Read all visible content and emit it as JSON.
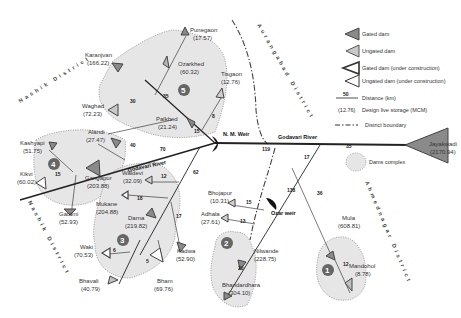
{
  "legend": {
    "gated_dam": "Gated dam",
    "ungated_dam": "Ungated dam",
    "gated_uc": "Gated dam (under construction)",
    "ungated_uc": "Ungated dam (under construction)",
    "distance_sample": "50",
    "distance": "Distance (km)",
    "storage_sample": "(12.76)",
    "storage": "Design live storage (MCM)",
    "boundary": "District boundary",
    "complex": "Dams complex"
  },
  "districts": {
    "nashik_top": "Nashik District",
    "nashik_bottom": "Nashik District",
    "aurangabad": "Aurangabad District",
    "ahmednagar": "Ahmednagar District"
  },
  "river": "Godavari River",
  "weirs": {
    "nm": "N. M. Weir",
    "ozar": "Ozar weir"
  },
  "complexes": [
    "1",
    "2",
    "3",
    "4",
    "5"
  ],
  "dams": {
    "pune": {
      "name": "Punegaon",
      "storage": "(17.57)"
    },
    "ozarkhed": {
      "name": "Ozarkhed",
      "storage": "(60.32)"
    },
    "karanjvan": {
      "name": "Karanjvan",
      "storage": "(166.22)"
    },
    "tisgaon": {
      "name": "Tisgaon",
      "storage": "(12.76)"
    },
    "waghad": {
      "name": "Waghad",
      "storage": "(72.23)"
    },
    "palkhed": {
      "name": "Palkhed",
      "storage": "(21.24)"
    },
    "jayakwadi": {
      "name": "Jayakwadi",
      "storage": "(2170.94)"
    },
    "kashyapi": {
      "name": "Kashyapi",
      "storage": "(51.75)"
    },
    "alandi": {
      "name": "Alandi",
      "storage": "(27.47)"
    },
    "kikvi": {
      "name": "Kikvi",
      "storage": "(60.02)"
    },
    "gangapur": {
      "name": "Gangapur",
      "storage": "(203.88)"
    },
    "gautmi": {
      "name": "Gautmi",
      "storage": "(52.93)"
    },
    "waldevi": {
      "name": "Waldevi",
      "storage": "(32.09)"
    },
    "mukane": {
      "name": "Mukane",
      "storage": "(204.88)"
    },
    "darna": {
      "name": "Darna",
      "storage": "(219.82)"
    },
    "kadwa": {
      "name": "Kadwa",
      "storage": "(52.90)"
    },
    "waki": {
      "name": "Waki",
      "storage": "(70.53)"
    },
    "bhavali": {
      "name": "Bhavali",
      "storage": "(40.79)"
    },
    "bham": {
      "name": "Bham",
      "storage": "(69.76)"
    },
    "bhojapur": {
      "name": "Bhojapur",
      "storage": "(10.31)"
    },
    "adhala": {
      "name": "Adhala",
      "storage": "(27.61)"
    },
    "nilwande": {
      "name": "Nilwande",
      "storage": "(228.75)"
    },
    "bhandardhara": {
      "name": "Bhandardhara",
      "storage": "(304.10)"
    },
    "mula": {
      "name": "Mula",
      "storage": "(608.81)"
    },
    "mandohol": {
      "name": "Mandohol",
      "storage": "(8.78)"
    }
  },
  "distances": {
    "d_nm_jay": "119",
    "d_jay": "35",
    "d_70": "70",
    "d_alandi": "40",
    "d_kikvi": "15",
    "d_palkhed": "15",
    "d_karanjvan": "35",
    "d_waghad": "30",
    "d_tisgaon": "8",
    "d_darna": "62",
    "d_waldevi": "12",
    "d_mukane": "18",
    "d_kadwa": "17",
    "d_waki": "6",
    "d_bham": "5",
    "d_ozar_river": "17",
    "d_ozar": "138",
    "d_bhojapur": "15",
    "d_adhala": "13",
    "d_bhandardhara": "20",
    "d_mula": "36",
    "d_mandohol": "12"
  }
}
